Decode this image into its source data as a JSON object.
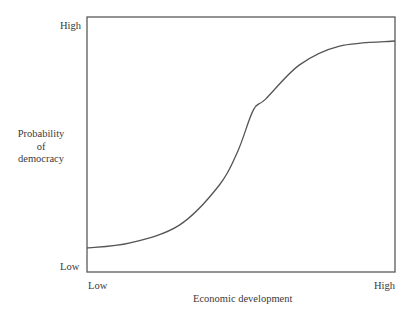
{
  "figure": {
    "y_axis": {
      "title_lines": [
        "Probability",
        "of",
        "democracy"
      ],
      "high_label": "High",
      "low_label": "Low"
    },
    "x_axis": {
      "title": "Economic development",
      "low_label": "Low",
      "high_label": "High"
    },
    "colors": {
      "line": "#555555",
      "axis": "#555555",
      "text": "#3a3a3a"
    }
  },
  "chart_data": {
    "type": "line",
    "title": "",
    "xlabel": "Economic development",
    "ylabel": "Probability of democracy",
    "x_tick_labels": [
      "Low",
      "High"
    ],
    "y_tick_labels": [
      "Low",
      "High"
    ],
    "xlim": [
      0,
      1
    ],
    "ylim": [
      0,
      1
    ],
    "grid": false,
    "legend": null,
    "series": [
      {
        "name": "Probability of democracy (S-curve)",
        "x": [
          0.0,
          0.14,
          0.3,
          0.43,
          0.49,
          0.54,
          0.58,
          0.69,
          0.82,
          1.0
        ],
        "y": [
          0.094,
          0.114,
          0.184,
          0.341,
          0.475,
          0.635,
          0.678,
          0.812,
          0.886,
          0.906
        ]
      }
    ]
  }
}
